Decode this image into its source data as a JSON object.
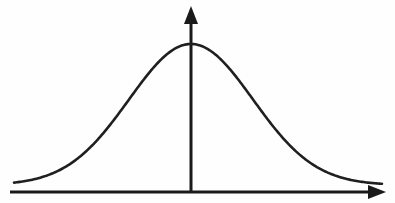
{
  "figure": {
    "background_color": "#fefefe",
    "line_color": "#1f1f1f",
    "axis_color": "#1a1a1a",
    "alt_text": "A symmetric bell-shaped normal distribution curve drawn above a horizontal axis, with a vertical axis through the peak. Both axes end in solid arrowheads."
  },
  "axes": {
    "x_axis": {
      "label": "",
      "start_x": 10,
      "end_x": 385,
      "y": 192,
      "arrowhead": "right-arrow-icon",
      "arrow_tip_x": 386,
      "arrow_length": 18,
      "arrow_half_height": 7
    },
    "y_axis": {
      "label": "",
      "x": 191,
      "start_y": 192,
      "end_y": 10,
      "arrowhead": "up-arrow-icon",
      "arrow_tip_y": 6,
      "arrow_length": 18,
      "arrow_half_height": 7
    }
  },
  "chart_data": {
    "type": "line",
    "subtitle": "",
    "xlabel": "",
    "ylabel": "",
    "grid": false,
    "legend": null,
    "legend_position": "none",
    "annotations": [],
    "tick_labels": {
      "x": [],
      "y": []
    },
    "xlim": [
      14,
      382
    ],
    "ylim": [
      185,
      44
    ],
    "curve": {
      "name": "normal-distribution",
      "mean_px": 191,
      "sigma_px": 62,
      "peak_y_px": 44,
      "baseline_y_px": 185,
      "amplitude_px": 141,
      "x": [
        14,
        28,
        42,
        56,
        70,
        84,
        98,
        112,
        126,
        140,
        154,
        168,
        182,
        191,
        200,
        214,
        228,
        242,
        256,
        270,
        284,
        298,
        312,
        326,
        340,
        354,
        368,
        382
      ],
      "y": [
        184.4,
        183.4,
        181.6,
        178.5,
        173.6,
        166.4,
        156.4,
        143.5,
        128.1,
        111.0,
        93.7,
        78.1,
        66.2,
        62.2,
        63.6,
        72.8,
        88.0,
        106.0,
        124.0,
        139.9,
        152.5,
        161.9,
        168.5,
        173.1,
        176.6,
        179.5,
        181.8,
        183.4
      ]
    }
  }
}
